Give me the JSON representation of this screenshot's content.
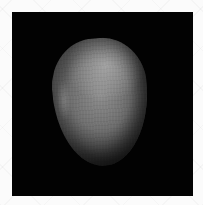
{
  "image": {
    "subject": "smooth rounded stone (pebble)",
    "background_color": "#020202",
    "border_color": "#fbfbfb",
    "stone_colors": {
      "highlight": "#c8c8c8",
      "midtone": "#7a7a7a",
      "shadow": "#151515"
    },
    "caption": "Egg-shaped grey pebble on black background"
  }
}
